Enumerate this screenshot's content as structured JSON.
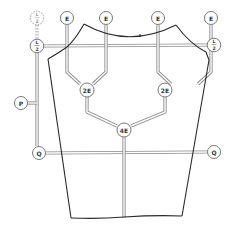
{
  "diagram": {
    "nodes": {
      "e1": {
        "label": "E"
      },
      "e2": {
        "label": "E"
      },
      "e3": {
        "label": "E"
      },
      "e4": {
        "label": "E"
      },
      "half_dashed": {
        "num": "L",
        "den": "2"
      },
      "half_left": {
        "num": "L",
        "den": "2"
      },
      "half_right": {
        "num": "L",
        "den": "2"
      },
      "p": {
        "label": "P"
      },
      "q_left": {
        "label": "Q"
      },
      "q_right": {
        "label": "Q"
      },
      "two_e_left": {
        "label": "2E"
      },
      "two_e_right": {
        "label": "2E"
      },
      "four_e": {
        "label": "4E"
      }
    },
    "colors": {
      "outline": "#2a2a2a",
      "rail": "#8a8a8a",
      "node_stroke": "#6a6a6a",
      "background": "#ffffff"
    }
  }
}
